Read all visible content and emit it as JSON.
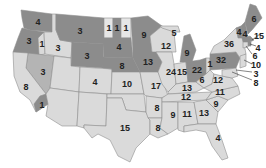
{
  "map": {
    "title": "",
    "colors": {
      "dark": "#8c8c8c",
      "mid": "#b4b4b4",
      "light": "#dadada",
      "pale": "#e6e6e6",
      "border": "#8f8f8f",
      "text": "#222222"
    },
    "states": [
      {
        "abbr": "WA",
        "value": "4",
        "shade": "dark"
      },
      {
        "abbr": "OR",
        "value": "3",
        "shade": "dark"
      },
      {
        "abbr": "ID-N",
        "value": "1",
        "shade": "light"
      },
      {
        "abbr": "ID",
        "value": "3",
        "shade": "light"
      },
      {
        "abbr": "MT",
        "value": "3",
        "shade": "dark"
      },
      {
        "abbr": "WY",
        "value": "3",
        "shade": "dark"
      },
      {
        "abbr": "NV",
        "value": "3",
        "shade": "mid"
      },
      {
        "abbr": "CA",
        "value": "8",
        "shade": "light"
      },
      {
        "abbr": "CA-S",
        "value": "1",
        "shade": "dark"
      },
      {
        "abbr": "UT",
        "value": "",
        "shade": "light"
      },
      {
        "abbr": "CO",
        "value": "4",
        "shade": "light"
      },
      {
        "abbr": "AZ",
        "value": "",
        "shade": "light"
      },
      {
        "abbr": "NM",
        "value": "",
        "shade": "light"
      },
      {
        "abbr": "ND-1",
        "value": "1",
        "shade": "pale"
      },
      {
        "abbr": "ND-2",
        "value": "1",
        "shade": "dark"
      },
      {
        "abbr": "ND-3",
        "value": "1",
        "shade": "pale"
      },
      {
        "abbr": "SD",
        "value": "4",
        "shade": "dark"
      },
      {
        "abbr": "NE",
        "value": "8",
        "shade": "dark"
      },
      {
        "abbr": "KS",
        "value": "10",
        "shade": "light"
      },
      {
        "abbr": "OK",
        "value": "",
        "shade": "light"
      },
      {
        "abbr": "TX",
        "value": "15",
        "shade": "light"
      },
      {
        "abbr": "MN",
        "value": "9",
        "shade": "dark"
      },
      {
        "abbr": "IA",
        "value": "13",
        "shade": "dark"
      },
      {
        "abbr": "MO",
        "value": "17",
        "shade": "light"
      },
      {
        "abbr": "AR",
        "value": "8",
        "shade": "light"
      },
      {
        "abbr": "LA",
        "value": "8",
        "shade": "light"
      },
      {
        "abbr": "WI",
        "value": "12",
        "shade": "light"
      },
      {
        "abbr": "MI-UP",
        "value": "5",
        "shade": "light"
      },
      {
        "abbr": "MI",
        "value": "9",
        "shade": "dark"
      },
      {
        "abbr": "IL",
        "value": "24",
        "shade": "light"
      },
      {
        "abbr": "IN",
        "value": "15",
        "shade": "light"
      },
      {
        "abbr": "OH",
        "value": "22",
        "shade": "dark"
      },
      {
        "abbr": "WV-N",
        "value": "1",
        "shade": "light"
      },
      {
        "abbr": "KY",
        "value": "13",
        "shade": "light"
      },
      {
        "abbr": "TN",
        "value": "12",
        "shade": "light"
      },
      {
        "abbr": "MS",
        "value": "9",
        "shade": "light"
      },
      {
        "abbr": "AL",
        "value": "11",
        "shade": "light"
      },
      {
        "abbr": "GA",
        "value": "13",
        "shade": "light"
      },
      {
        "abbr": "FL",
        "value": "4",
        "shade": "light"
      },
      {
        "abbr": "SC",
        "value": "9",
        "shade": "light"
      },
      {
        "abbr": "NC",
        "value": "11",
        "shade": "light"
      },
      {
        "abbr": "WV",
        "value": "6",
        "shade": "light"
      },
      {
        "abbr": "VA",
        "value": "12",
        "shade": "light"
      },
      {
        "abbr": "PA",
        "value": "32",
        "shade": "dark"
      },
      {
        "abbr": "NY",
        "value": "36",
        "shade": "light"
      },
      {
        "abbr": "VT",
        "value": "4",
        "shade": "dark"
      },
      {
        "abbr": "NH",
        "value": "4",
        "shade": "dark"
      },
      {
        "abbr": "ME",
        "value": "6",
        "shade": "dark"
      },
      {
        "abbr": "MA",
        "value": "15",
        "shade": "dark"
      },
      {
        "abbr": "RI",
        "value": "4",
        "shade": "dark"
      },
      {
        "abbr": "CT",
        "value": "6",
        "shade": "light"
      },
      {
        "abbr": "NJ",
        "value": "10",
        "shade": "light"
      },
      {
        "abbr": "DE",
        "value": "3",
        "shade": "light"
      },
      {
        "abbr": "MD",
        "value": "8",
        "shade": "light"
      }
    ]
  }
}
